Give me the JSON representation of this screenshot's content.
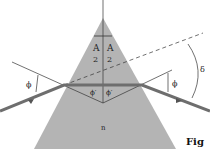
{
  "figure": {
    "labels": {
      "apex_left": "A",
      "apex_right": "A",
      "apex_den_left": "2",
      "apex_den_right": "2",
      "phi_left": "ϕ",
      "phi_right": "ϕ",
      "phi_prime_left": "ϕ′",
      "phi_prime_right": "ϕ′",
      "delta": "δ",
      "index": "n"
    },
    "caption": "Fig",
    "colors": {
      "prism": "#b4b4b4",
      "ray": "#6e6e6e",
      "line": "#333333"
    }
  }
}
